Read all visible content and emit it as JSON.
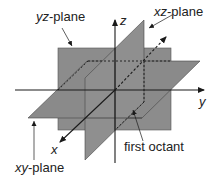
{
  "diagram": {
    "labels": {
      "yz_plane_var": "yz",
      "yz_plane_suffix": "-plane",
      "xz_plane_var": "xz",
      "xz_plane_suffix": "-plane",
      "xy_plane_var": "xy",
      "xy_plane_suffix": "-plane",
      "first_octant": "first octant",
      "axis_x": "x",
      "axis_y": "y",
      "axis_z": "z"
    },
    "colors": {
      "plane_fill": "#8a8a8a",
      "line": "#1a1a1a",
      "background": "#ffffff"
    }
  }
}
